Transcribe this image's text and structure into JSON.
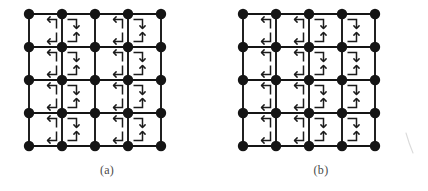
{
  "figure": {
    "kind": "lattice-diagram",
    "background_color": "#ffffff",
    "ink_color": "#151515",
    "caption_color": "#4a4a4a",
    "panel_count": 2
  },
  "panels": [
    {
      "id": "a",
      "caption": "(a)",
      "grid": {
        "rows": 5,
        "cols": 5,
        "x0": 29,
        "y0": 14,
        "step": 33,
        "node_radius": 5.2,
        "node_color": "#151515",
        "edge_color": "#151515",
        "edge_width": 1.9
      },
      "arrow_color": "#1b1b1b",
      "arrow_width": 1.5,
      "cells": [
        {
          "r": 0,
          "c": 0,
          "corners": [
            "tr-left",
            "br-left"
          ]
        },
        {
          "r": 0,
          "c": 1,
          "corners": [
            "tl-down",
            "bl-up"
          ]
        },
        {
          "r": 0,
          "c": 2,
          "corners": [
            "tr-left",
            "br-left"
          ]
        },
        {
          "r": 0,
          "c": 3,
          "corners": [
            "tl-down",
            "bl-up"
          ]
        },
        {
          "r": 1,
          "c": 0,
          "corners": [
            "tr-left",
            "br-left"
          ]
        },
        {
          "r": 1,
          "c": 1,
          "corners": [
            "tl-down",
            "bl-up"
          ]
        },
        {
          "r": 1,
          "c": 2,
          "corners": [
            "tr-left",
            "br-left"
          ]
        },
        {
          "r": 1,
          "c": 3,
          "corners": [
            "tl-down",
            "bl-up"
          ]
        },
        {
          "r": 2,
          "c": 0,
          "corners": [
            "tr-left",
            "br-left"
          ]
        },
        {
          "r": 2,
          "c": 1,
          "corners": [
            "tl-down",
            "bl-up"
          ]
        },
        {
          "r": 2,
          "c": 2,
          "corners": [
            "tr-left",
            "br-left"
          ]
        },
        {
          "r": 2,
          "c": 3,
          "corners": [
            "tl-down",
            "bl-up"
          ]
        },
        {
          "r": 3,
          "c": 0,
          "corners": [
            "tr-left",
            "br-left"
          ]
        },
        {
          "r": 3,
          "c": 1,
          "corners": [
            "tl-down",
            "bl-up"
          ]
        },
        {
          "r": 3,
          "c": 2,
          "corners": [
            "tr-left",
            "br-left"
          ]
        },
        {
          "r": 3,
          "c": 3,
          "corners": [
            "tl-down",
            "bl-up"
          ]
        }
      ]
    },
    {
      "id": "b",
      "caption": "(b)",
      "grid": {
        "rows": 5,
        "cols": 5,
        "x0": 29,
        "y0": 14,
        "step": 33,
        "node_radius": 5.2,
        "node_color": "#151515",
        "edge_color": "#151515",
        "edge_width": 1.9
      },
      "arrow_color": "#1b1b1b",
      "arrow_width": 1.5,
      "cells": [
        {
          "r": 0,
          "c": 0,
          "corners": [
            "tr-left",
            "br-left"
          ]
        },
        {
          "r": 0,
          "c": 1,
          "corners": [
            "tr-left",
            "br-left"
          ]
        },
        {
          "r": 0,
          "c": 2,
          "corners": [
            "tl-down",
            "bl-up"
          ]
        },
        {
          "r": 0,
          "c": 3,
          "corners": [
            "tl-down",
            "bl-up"
          ]
        },
        {
          "r": 1,
          "c": 0,
          "corners": [
            "tr-left",
            "br-left"
          ]
        },
        {
          "r": 1,
          "c": 1,
          "corners": [
            "tr-left",
            "br-left"
          ]
        },
        {
          "r": 1,
          "c": 2,
          "corners": [
            "tl-down",
            "bl-up"
          ]
        },
        {
          "r": 1,
          "c": 3,
          "corners": [
            "tl-down",
            "bl-up"
          ]
        },
        {
          "r": 2,
          "c": 0,
          "corners": [
            "tr-left",
            "br-left"
          ]
        },
        {
          "r": 2,
          "c": 1,
          "corners": [
            "tr-left",
            "br-left"
          ]
        },
        {
          "r": 2,
          "c": 2,
          "corners": [
            "tl-down",
            "bl-up"
          ]
        },
        {
          "r": 2,
          "c": 3,
          "corners": [
            "tl-down",
            "bl-up"
          ]
        },
        {
          "r": 3,
          "c": 0,
          "corners": [
            "tr-left",
            "br-left"
          ]
        },
        {
          "r": 3,
          "c": 1,
          "corners": [
            "tr-left",
            "br-left"
          ]
        },
        {
          "r": 3,
          "c": 2,
          "corners": [
            "tl-down",
            "bl-up"
          ]
        },
        {
          "r": 3,
          "c": 3,
          "corners": [
            "tl-down",
            "bl-up"
          ]
        }
      ]
    }
  ],
  "artifact": {
    "present": true,
    "description": "scan-artifact-stroke"
  }
}
